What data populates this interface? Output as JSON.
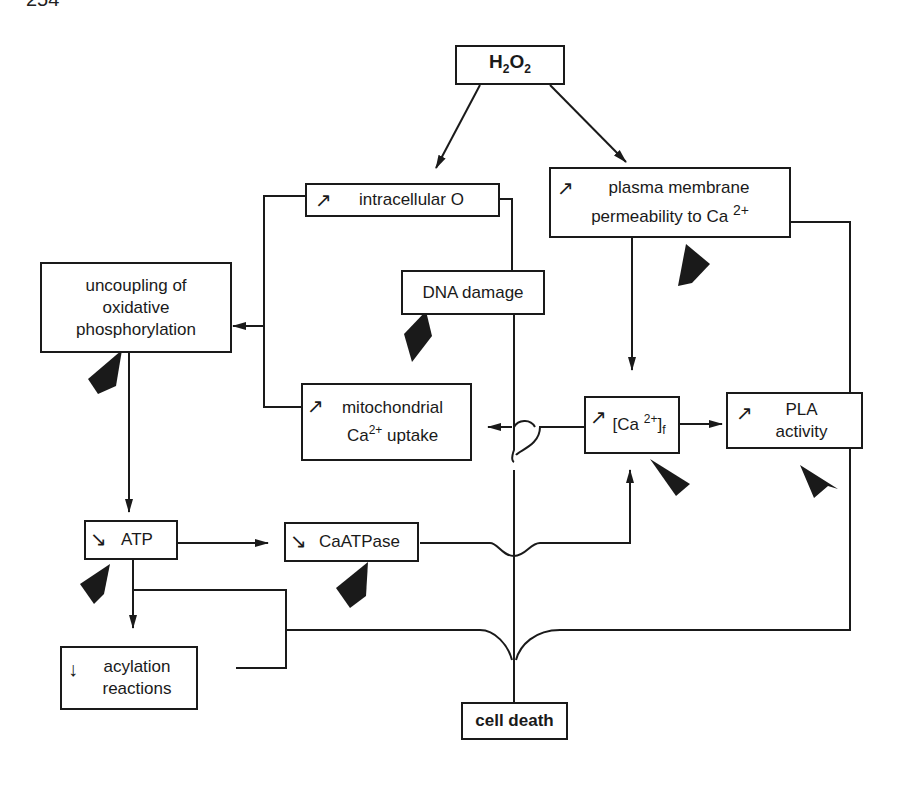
{
  "page_number": "254",
  "diagram": {
    "nodes": {
      "h2o2": {
        "label": "H",
        "sub1": "2",
        "mid": "O",
        "sub2": "2"
      },
      "intracellular_o": {
        "indicator": "increase",
        "label": "intracellular O"
      },
      "plasma_membrane": {
        "indicator": "increase",
        "line1": "plasma membrane",
        "line2": "permeability to Ca",
        "sup": "2+"
      },
      "uncoupling": {
        "line1": "uncoupling of",
        "line2": "oxidative",
        "line3": "phosphorylation"
      },
      "dna_damage": {
        "label": "DNA damage"
      },
      "mito_uptake": {
        "indicator": "increase",
        "line1": "mitochondrial",
        "line2a": "Ca",
        "sup": "2+",
        "line2b": "uptake"
      },
      "ca_free": {
        "indicator": "increase",
        "pre": "[Ca",
        "sup": "2+",
        "post": "]",
        "sub": "f"
      },
      "pla": {
        "indicator": "increase",
        "line1": "PLA",
        "line2": "activity"
      },
      "atp": {
        "indicator": "decrease",
        "label": "ATP"
      },
      "caatpase": {
        "indicator": "decrease",
        "label": "CaATPase"
      },
      "acylation": {
        "indicator": "decrease",
        "line1": "acylation",
        "line2": "reactions"
      },
      "cell_death": {
        "label": "cell death"
      }
    },
    "edges": [
      {
        "from": "H2O2",
        "to": "intracellular O"
      },
      {
        "from": "H2O2",
        "to": "plasma membrane permeability to Ca2+"
      },
      {
        "from": "intracellular O",
        "to": "uncoupling of oxidative phosphorylation"
      },
      {
        "from": "mitochondrial Ca2+ uptake",
        "to": "uncoupling of oxidative phosphorylation"
      },
      {
        "from": "intracellular O",
        "to": "DNA damage"
      },
      {
        "from": "plasma membrane permeability to Ca2+",
        "to": "[Ca2+]f"
      },
      {
        "from": "[Ca2+]f",
        "to": "mitochondrial Ca2+ uptake"
      },
      {
        "from": "[Ca2+]f",
        "to": "PLA activity"
      },
      {
        "from": "uncoupling of oxidative phosphorylation",
        "to": "ATP"
      },
      {
        "from": "ATP",
        "to": "CaATPase"
      },
      {
        "from": "CaATPase",
        "to": "[Ca2+]f"
      },
      {
        "from": "ATP",
        "to": "acylation reactions"
      },
      {
        "from": "DNA damage",
        "to": "cell death"
      },
      {
        "from": "ATP / acylation reactions",
        "to": "cell death"
      },
      {
        "from": "plasma membrane / PLA activity",
        "to": "cell death"
      }
    ]
  }
}
